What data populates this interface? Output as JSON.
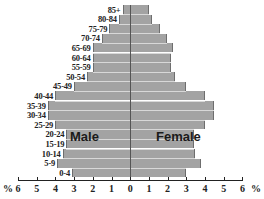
{
  "chart_data": {
    "type": "bar",
    "subtype": "population-pyramid",
    "title": "",
    "xlabel": "%",
    "ylabel": "",
    "categories": [
      "85+",
      "80-84",
      "75-79",
      "70-74",
      "65-69",
      "60-64",
      "55-59",
      "50-54",
      "45-49",
      "40-44",
      "35-39",
      "30-34",
      "25-29",
      "20-24",
      "15-19",
      "10-14",
      "5-9",
      "0-4"
    ],
    "series": [
      {
        "name": "Male",
        "values": [
          0.4,
          0.6,
          1.1,
          1.5,
          2.0,
          2.0,
          2.0,
          2.3,
          3.0,
          4.0,
          4.4,
          4.4,
          4.0,
          3.4,
          3.4,
          3.6,
          3.9,
          3.1
        ]
      },
      {
        "name": "Female",
        "values": [
          1.0,
          1.2,
          1.6,
          2.0,
          2.3,
          2.2,
          2.2,
          2.4,
          3.0,
          4.0,
          4.5,
          4.5,
          4.0,
          3.4,
          3.4,
          3.5,
          3.8,
          3.0
        ]
      }
    ],
    "xlim": [
      -6,
      6
    ],
    "x_ticks": [
      "6",
      "5",
      "4",
      "3",
      "2",
      "1",
      "0",
      "1",
      "2",
      "3",
      "4",
      "5",
      "6"
    ],
    "x_unit_label_left": "%",
    "x_unit_label_right": "%",
    "grid": false,
    "legend": "inline labels",
    "bar_color": "#a3a3a3"
  },
  "labels": {
    "male": "Male",
    "female": "Female"
  }
}
